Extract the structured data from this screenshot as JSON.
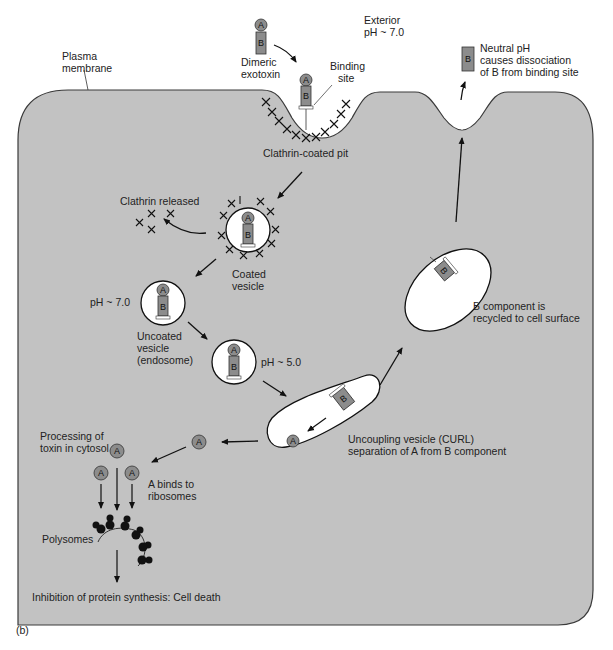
{
  "figure": {
    "panel_label": "(b)",
    "colors": {
      "cell_fill": "#c2c2c2",
      "cell_outline": "#3a3a3a",
      "vesicle_fill": "#ffffff",
      "toxin_fill": "#8c8c8c",
      "ink": "#111111",
      "background": "#ffffff"
    }
  },
  "labels": {
    "plasma_membrane": [
      "Plasma",
      "membrane"
    ],
    "dimeric_exotoxin": [
      "Dimeric",
      "exotoxin"
    ],
    "exterior": [
      "Exterior",
      "pH ~ 7.0"
    ],
    "binding_site": [
      "Binding",
      "site"
    ],
    "neutral_ph": [
      "Neutral pH",
      "causes dissociation",
      "of B from binding site"
    ],
    "clathrin_coated_pit": "Clathrin-coated pit",
    "clathrin_released": "Clathrin released",
    "coated_vesicle": [
      "Coated",
      "vesicle"
    ],
    "ph_70": "pH ~ 7.0",
    "uncoated_vesicle": [
      "Uncoated",
      "vesicle",
      "(endosome)"
    ],
    "ph_50": "pH ~ 5.0",
    "b_recycled": [
      "B component is",
      "recycled to cell surface"
    ],
    "curl": [
      "Uncoupling vesicle (CURL)",
      "separation of A from B component"
    ],
    "processing": [
      "Processing of",
      "toxin in cytosol"
    ],
    "a_binds": [
      "A binds to",
      "ribosomes"
    ],
    "polysomes": "Polysomes",
    "inhibition": "Inhibition of protein synthesis: Cell death"
  },
  "glyphs": {
    "a": "A",
    "b": "B"
  }
}
